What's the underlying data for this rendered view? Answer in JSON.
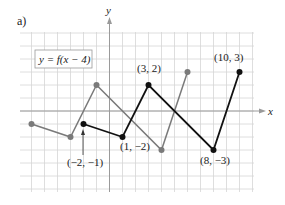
{
  "panel_label": "a)",
  "equation": "y = f(x − 4)",
  "axes": {
    "xlabel": "x",
    "ylabel": "y"
  },
  "annotations": {
    "p1": "(−2, −1)",
    "p2": "(1, −2)",
    "p3": "(3, 2)",
    "p4": "(8, −3)",
    "p5": "(10, 3)"
  },
  "chart_data": {
    "type": "line",
    "title": "y = f(x − 4)",
    "xlabel": "x",
    "ylabel": "y",
    "grid": true,
    "xlim": [
      -7,
      11
    ],
    "ylim": [
      -6,
      6
    ],
    "series": [
      {
        "name": "f(x) (original)",
        "color": "#7a7a7a",
        "points": [
          [
            -6,
            -1
          ],
          [
            -3,
            -2
          ],
          [
            -1,
            2
          ],
          [
            4,
            -3
          ],
          [
            6,
            3
          ]
        ]
      },
      {
        "name": "f(x − 4) (shifted)",
        "color": "#111111",
        "points": [
          [
            -2,
            -1
          ],
          [
            1,
            -2
          ],
          [
            3,
            2
          ],
          [
            8,
            -3
          ],
          [
            10,
            3
          ]
        ]
      }
    ],
    "annotations": [
      "(−2, −1)",
      "(1, −2)",
      "(3, 2)",
      "(8, −3)",
      "(10, 3)"
    ]
  }
}
